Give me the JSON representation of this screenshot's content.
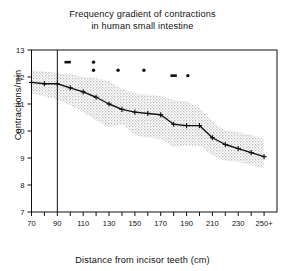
{
  "chart_data": {
    "type": "line",
    "title": "Frequency gradient of contractions in human small intestine",
    "title_line1": "Frequency gradient of contractions",
    "title_line2": "in human small intestine",
    "xlabel": "Distance from incisor teeth (cm)",
    "ylabel": "Contractions/min",
    "xlim": [
      70,
      260
    ],
    "ylim": [
      7,
      13
    ],
    "grid": false,
    "legend": "none",
    "y_ticks": [
      7,
      8,
      9,
      10,
      11,
      12,
      13
    ],
    "y_tick_labels": [
      "7",
      "8",
      "9",
      "10",
      "11",
      "12",
      "13"
    ],
    "x_ticks": [
      70,
      80,
      90,
      100,
      110,
      120,
      130,
      140,
      150,
      160,
      170,
      180,
      190,
      200,
      210,
      220,
      230,
      240,
      250
    ],
    "x_tick_labels": [
      "70",
      "",
      "90",
      "",
      "110",
      "",
      "130",
      "",
      "150",
      "",
      "170",
      "",
      "190",
      "",
      "210",
      "",
      "230",
      "",
      "250+"
    ],
    "x": [
      70,
      80,
      90,
      100,
      110,
      120,
      130,
      140,
      150,
      160,
      170,
      180,
      190,
      200,
      210,
      220,
      230,
      240,
      250
    ],
    "series": [
      {
        "name": "mean frequency",
        "marker": "plus",
        "values": [
          11.8,
          11.75,
          11.75,
          11.6,
          11.45,
          11.25,
          11.0,
          10.8,
          10.7,
          10.65,
          10.6,
          10.25,
          10.2,
          10.2,
          9.75,
          9.5,
          9.35,
          9.2,
          9.05
        ]
      },
      {
        "name": "upper band",
        "style": "stippled-shading",
        "values": [
          12.25,
          12.2,
          12.15,
          12.1,
          12.0,
          11.95,
          11.85,
          11.55,
          11.4,
          11.35,
          11.3,
          11.15,
          11.1,
          10.85,
          10.35,
          10.0,
          9.95,
          9.85,
          9.7
        ]
      },
      {
        "name": "lower band",
        "style": "stippled-shading",
        "values": [
          11.4,
          11.3,
          11.15,
          10.95,
          10.7,
          10.4,
          10.15,
          10.25,
          9.85,
          9.75,
          9.7,
          9.4,
          9.45,
          9.45,
          9.1,
          8.9,
          8.85,
          8.75,
          8.6
        ]
      }
    ],
    "annotation_points": {
      "name": "individual outlier markers",
      "marker": "dot",
      "points": [
        {
          "x": 98,
          "y": 12.55,
          "wide": true
        },
        {
          "x": 118,
          "y": 12.55
        },
        {
          "x": 118,
          "y": 12.25
        },
        {
          "x": 137,
          "y": 12.25
        },
        {
          "x": 157,
          "y": 12.25
        },
        {
          "x": 180,
          "y": 12.05,
          "wide": true
        },
        {
          "x": 191,
          "y": 12.05
        }
      ]
    },
    "reference_line": {
      "name": "vertical marker at 90 cm",
      "x": 90
    },
    "colors": {
      "axis": "#111111",
      "line": "#111111",
      "band": "#c9c9c9",
      "background": "#ffffff"
    }
  }
}
